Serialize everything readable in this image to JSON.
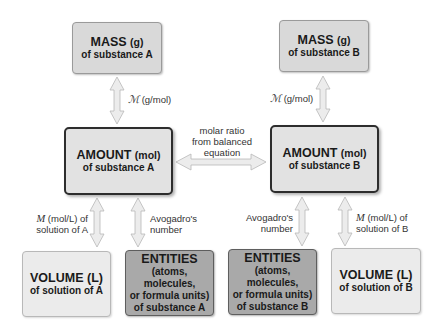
{
  "diagram": {
    "colors": {
      "mass_fill": "#d9d9d9",
      "amount_fill": "#e2e2e2",
      "amount_border": "#2d2d2d",
      "volume_fill": "#ebebeb",
      "entities_fill": "#a9a9a9",
      "arrow_fill": "#e8e8e8",
      "arrow_stroke": "#bdbdbd"
    },
    "boxes": {
      "mass_a": {
        "title": "MASS",
        "unit": "(g)",
        "sub": "of substance A"
      },
      "mass_b": {
        "title": "MASS",
        "unit": "(g)",
        "sub": "of substance B"
      },
      "amount_a": {
        "title": "AMOUNT",
        "unit": "(mol)",
        "sub": "of substance A"
      },
      "amount_b": {
        "title": "AMOUNT",
        "unit": "(mol)",
        "sub": "of substance B"
      },
      "volume_a": {
        "title": "VOLUME (L)",
        "sub": "of solution of A"
      },
      "volume_b": {
        "title": "VOLUME (L)",
        "sub": "of solution of B"
      },
      "entities_a": {
        "title": "ENTITIES",
        "line1": "(atoms, molecules,",
        "line2": "or formula units)",
        "line3": "of substance A"
      },
      "entities_b": {
        "title": "ENTITIES",
        "line1": "(atoms, molecules,",
        "line2": "or formula units)",
        "line3": "of substance B"
      }
    },
    "arrow_labels": {
      "molar_mass_a": {
        "symbol": "ℳ",
        "text": " (g/mol)"
      },
      "molar_mass_b": {
        "symbol": "ℳ",
        "text": " (g/mol)"
      },
      "molar_ratio": {
        "line1": "molar ratio",
        "line2": "from balanced",
        "line3": "equation"
      },
      "molarity_a": {
        "symbol": "M",
        "text1": " (mol/L) of",
        "text2": "solution of A"
      },
      "molarity_b": {
        "symbol": "M",
        "text1": " (mol/L) of",
        "text2": "solution of B"
      },
      "avogadro_a": {
        "line1": "Avogadro's",
        "line2": "number"
      },
      "avogadro_b": {
        "line1": "Avogadro's",
        "line2": "number"
      }
    }
  }
}
